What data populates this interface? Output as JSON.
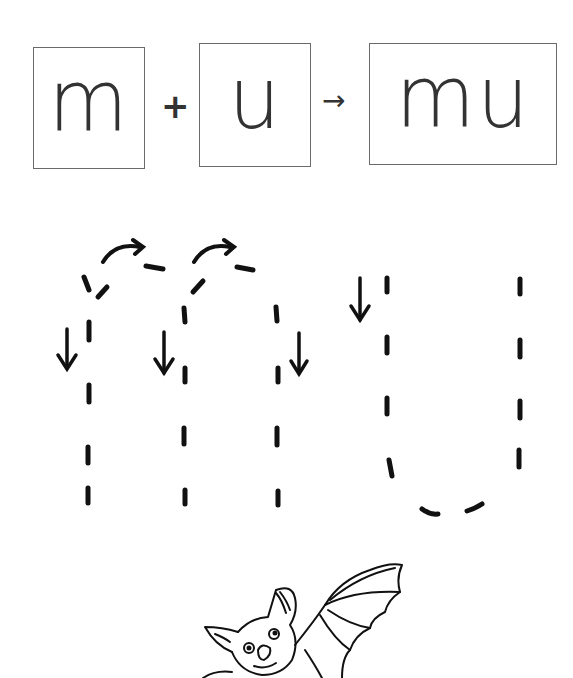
{
  "formula": {
    "first": "m",
    "operator_plus": "+",
    "second": "u",
    "operator_arrow": "→",
    "result": "mu"
  },
  "tracing": {
    "word": "mu",
    "guide_icons": [
      "curved-arrow-icon",
      "curved-arrow-icon",
      "down-arrow-icon",
      "down-arrow-icon",
      "down-arrow-icon",
      "down-arrow-icon"
    ],
    "stroke_color": "#111111"
  },
  "illustration": {
    "subject": "bat"
  },
  "colors": {
    "box_border": "#6b6b6b",
    "letter": "#333333",
    "background": "#ffffff"
  }
}
